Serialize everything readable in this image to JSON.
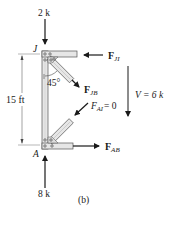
{
  "figure": {
    "caption": "(b)",
    "colors": {
      "member_fill": "#e6e6e6",
      "member_stroke": "#555555",
      "arrow": "#1a1a1a",
      "dimension": "#777777"
    }
  },
  "joints": {
    "top": "J",
    "bottom": "A"
  },
  "loads": {
    "top_load": "2 k",
    "bottom_reaction": "8 k"
  },
  "forces": {
    "f_ji": {
      "symbol": "F",
      "subscript": "JI"
    },
    "f_jb": {
      "symbol": "F",
      "subscript": "JB"
    },
    "f_ai": {
      "symbol": "F",
      "subscript": "AI",
      "value_text": "= 0"
    },
    "f_ab": {
      "symbol": "F",
      "subscript": "AB"
    }
  },
  "shear": {
    "label": "V = 6 k"
  },
  "dimension": {
    "height": "15 ft"
  },
  "angle": {
    "label": "45°"
  }
}
